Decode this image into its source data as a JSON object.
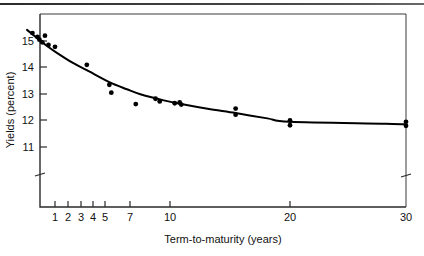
{
  "chart_data": {
    "type": "scatter",
    "title": "",
    "subtitle": "",
    "xlabel": "Term-to-maturity (years)",
    "ylabel": "Yields (percent)",
    "xscale": "log",
    "yscale": "linear",
    "xlim": [
      0.6,
      30
    ],
    "ylim": [
      10.3,
      15.6
    ],
    "grid": false,
    "legend": null,
    "x_ticks": [
      1,
      2,
      3,
      4,
      5,
      7,
      10,
      20,
      30
    ],
    "x_tick_labels": [
      "1",
      "2",
      "3",
      "4",
      "5",
      "7",
      "10",
      "20",
      "30"
    ],
    "y_ticks": [
      11,
      12,
      13,
      14,
      15
    ],
    "y_tick_labels": [
      "11",
      "12",
      "13",
      "14",
      "15"
    ],
    "axis_breaks": {
      "y_axis_break_below": 11,
      "x_axis_break_before": 30
    },
    "series": [
      {
        "name": "Observed yields",
        "type": "scatter",
        "marker": "filled-circle",
        "color": "#000000",
        "points": [
          {
            "x": 0.75,
            "y": 15.3
          },
          {
            "x": 0.8,
            "y": 15.15
          },
          {
            "x": 0.82,
            "y": 15.05
          },
          {
            "x": 0.85,
            "y": 14.95
          },
          {
            "x": 0.88,
            "y": 15.2
          },
          {
            "x": 0.92,
            "y": 14.85
          },
          {
            "x": 1.0,
            "y": 14.78
          },
          {
            "x": 1.5,
            "y": 14.1
          },
          {
            "x": 2.0,
            "y": 13.35
          },
          {
            "x": 2.05,
            "y": 13.05
          },
          {
            "x": 2.8,
            "y": 12.62
          },
          {
            "x": 3.6,
            "y": 12.82
          },
          {
            "x": 3.8,
            "y": 12.72
          },
          {
            "x": 4.6,
            "y": 12.65
          },
          {
            "x": 4.9,
            "y": 12.68
          },
          {
            "x": 5.0,
            "y": 12.6
          },
          {
            "x": 10.0,
            "y": 12.45
          },
          {
            "x": 10.0,
            "y": 12.22
          },
          {
            "x": 20.0,
            "y": 12.0
          },
          {
            "x": 20.0,
            "y": 11.82
          },
          {
            "x": 30.0,
            "y": 11.95
          },
          {
            "x": 30.0,
            "y": 11.8
          }
        ]
      },
      {
        "name": "Fitted yield curve",
        "type": "line",
        "color": "#000000",
        "curve": [
          {
            "x": 0.7,
            "y": 15.42
          },
          {
            "x": 0.8,
            "y": 15.1
          },
          {
            "x": 0.9,
            "y": 14.82
          },
          {
            "x": 1.0,
            "y": 14.6
          },
          {
            "x": 1.25,
            "y": 14.18
          },
          {
            "x": 1.5,
            "y": 13.9
          },
          {
            "x": 2.0,
            "y": 13.45
          },
          {
            "x": 2.5,
            "y": 13.18
          },
          {
            "x": 3.0,
            "y": 12.98
          },
          {
            "x": 4.0,
            "y": 12.76
          },
          {
            "x": 5.0,
            "y": 12.62
          },
          {
            "x": 7.0,
            "y": 12.44
          },
          {
            "x": 10.0,
            "y": 12.28
          },
          {
            "x": 15.0,
            "y": 12.08
          },
          {
            "x": 20.0,
            "y": 11.95
          },
          {
            "x": 25.0,
            "y": 11.88
          },
          {
            "x": 30.0,
            "y": 11.85
          }
        ]
      }
    ]
  },
  "figure": {
    "scan_artifact_label": "scan-edge-band",
    "frame_color": "#2a2a2a",
    "background": "#ffffff"
  }
}
